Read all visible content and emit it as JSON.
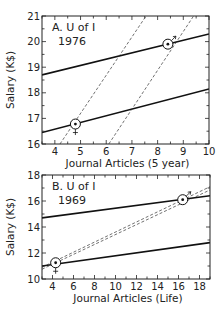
{
  "chart_data": [
    {
      "type": "line",
      "title": "A. U of I 1976",
      "panel_label": "A. U of I",
      "panel_year": "1976",
      "xlabel": "Journal Articles (5 year)",
      "ylabel": "Salary (K$)",
      "xlim": [
        3.5,
        10
      ],
      "ylim": [
        16,
        21
      ],
      "xticks": [
        4,
        5,
        6,
        7,
        8,
        9,
        10
      ],
      "yticks": [
        16,
        17,
        18,
        19,
        20,
        21
      ],
      "series": [
        {
          "name": "male (solid)",
          "style": "solid",
          "x": [
            3.5,
            10
          ],
          "y": [
            18.7,
            20.3
          ]
        },
        {
          "name": "female (solid)",
          "style": "solid",
          "x": [
            3.5,
            10
          ],
          "y": [
            16.45,
            18.15
          ]
        },
        {
          "name": "dashed left",
          "style": "dashed",
          "x": [
            4.2,
            7.55
          ],
          "y": [
            16,
            21
          ]
        },
        {
          "name": "dashed right",
          "style": "dashed",
          "x": [
            6.1,
            9.4
          ],
          "y": [
            16,
            21
          ]
        }
      ],
      "points": [
        {
          "label": "female mean",
          "symbol": "female",
          "x": 4.8,
          "y": 16.78
        },
        {
          "label": "male mean",
          "symbol": "male",
          "x": 8.4,
          "y": 19.9
        }
      ]
    },
    {
      "type": "line",
      "title": "B. U of I 1969",
      "panel_label": "B. U of I",
      "panel_year": "1969",
      "xlabel": "Journal Articles (Life)",
      "ylabel": "Salary (K$)",
      "xlim": [
        3,
        19
      ],
      "ylim": [
        10,
        18
      ],
      "xticks": [
        4,
        6,
        8,
        10,
        12,
        14,
        16,
        18
      ],
      "yticks": [
        10,
        12,
        14,
        16,
        18
      ],
      "series": [
        {
          "name": "male (solid)",
          "style": "solid",
          "x": [
            3,
            19
          ],
          "y": [
            14.7,
            16.4
          ]
        },
        {
          "name": "female (solid)",
          "style": "solid",
          "x": [
            3,
            19
          ],
          "y": [
            11.0,
            12.8
          ]
        },
        {
          "name": "dashed upper",
          "style": "dashed",
          "x": [
            3,
            19
          ],
          "y": [
            10.9,
            17.1
          ]
        },
        {
          "name": "dashed lower",
          "style": "dashed",
          "x": [
            3,
            19
          ],
          "y": [
            10.75,
            16.85
          ]
        }
      ],
      "points": [
        {
          "label": "female mean",
          "symbol": "female",
          "x": 4.3,
          "y": 11.25
        },
        {
          "label": "male mean",
          "symbol": "male",
          "x": 16.4,
          "y": 16.1
        }
      ]
    }
  ]
}
